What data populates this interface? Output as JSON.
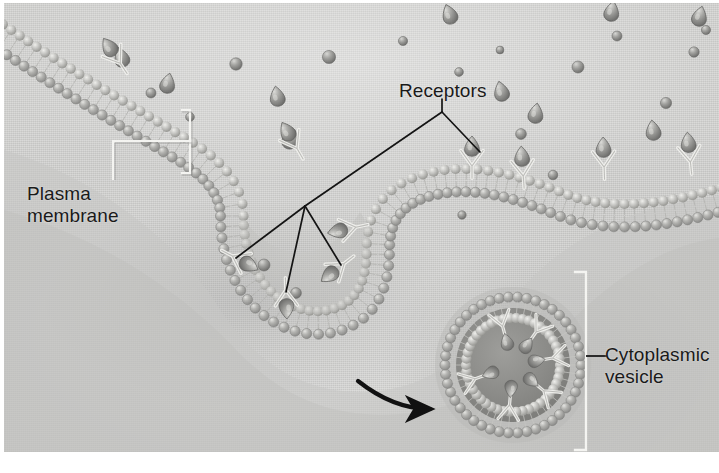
{
  "figure": {
    "width": 719,
    "height": 473,
    "medium": "airbrush illustration, grayscale halftone plate"
  },
  "labels": {
    "plasma_membrane": "Plasma\nmembrane",
    "receptors": "Receptors",
    "cytoplasmic_vesicle": "Cytoplasmic\nvesicle"
  },
  "colors": {
    "label_text": "#1a1a1a",
    "leader_dark": "#151515",
    "bracket_light": "#f2f2ef",
    "membrane_head": "#9a9a98",
    "membrane_head_light": "#c9c9c6",
    "membrane_tail": "#b4b4b1",
    "ligand": "#8e8e8c",
    "receptor_stroke": "#efefec",
    "extracellular_bg": "#e9e9e7",
    "cytoplasm_bg": "#cdcdcb",
    "plate_border": "#ffffff"
  },
  "structures": {
    "membrane": {
      "name": "phospholipid bilayer",
      "description": "double row of spherical head groups with hairlike fatty-acid tails between them",
      "head_radius_px": 5
    },
    "coated_pit": {
      "name": "invaginating coated pit",
      "center": [
        300,
        262
      ],
      "description": "deep U-shaped invagination of the plasma membrane capturing receptor-bound ligands"
    },
    "vesicle": {
      "name": "cytoplasmic vesicle",
      "center": [
        513,
        365
      ],
      "radius_px": 73,
      "description": "pinched-off spherical vesicle with receptors and bound ligands facing the lumen"
    },
    "arrow": {
      "name": "process arrow",
      "from": [
        360,
        383
      ],
      "to": [
        434,
        409
      ],
      "description": "curved arrow indicating pinching off of the vesicle into the cytoplasm"
    }
  },
  "leaders": {
    "plasma_membrane": {
      "type": "bracket-with-stem",
      "bracket": [
        188,
        108,
        188,
        172
      ],
      "stem": [
        188,
        140,
        113,
        140,
        113,
        178
      ]
    },
    "receptors": {
      "type": "fan",
      "hub_upper": [
        442,
        106
      ],
      "hub_lower": [
        305,
        206
      ],
      "targets": [
        [
          475,
          152
        ],
        [
          232,
          255
        ],
        [
          287,
          285
        ],
        [
          340,
          262
        ]
      ]
    },
    "cytoplasmic_vesicle": {
      "type": "bracket-with-stem",
      "bracket": [
        584,
        272,
        584,
        450
      ],
      "stem": [
        584,
        358,
        604,
        358
      ]
    }
  },
  "elements": {
    "free_ligands_count": 12,
    "free_particles_count": 16,
    "surface_receptors_count": 6,
    "pit_receptors_count": 4,
    "vesicle_receptors_count": 6,
    "ligand_shape": "teardrop",
    "receptor_shape": "Y-shaped"
  },
  "icons": {
    "process_arrow": "curved-arrow-icon",
    "receptor": "y-receptor-icon",
    "ligand": "teardrop-ligand-icon"
  }
}
